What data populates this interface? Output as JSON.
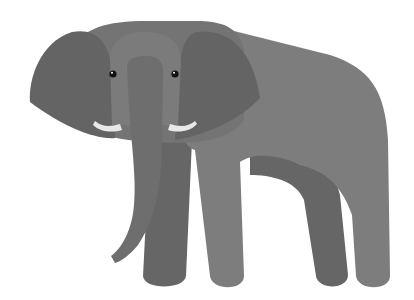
{
  "image": {
    "subject": "elephant",
    "style": "flat illustration",
    "background": "#ffffff",
    "colors": {
      "body": "#7d7d7d",
      "head": "#747474",
      "ears": "#646464",
      "far_legs": "#666666",
      "trunk": "#6e6e6e",
      "forehead": "#7b7b7b",
      "tusks": "#e8e8e8",
      "eyes": "#111111",
      "eye_highlight": "#ffffff"
    }
  }
}
